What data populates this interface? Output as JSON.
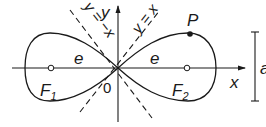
{
  "figure": {
    "labels": {
      "y_axis": "y",
      "x_axis": "x",
      "origin": "0",
      "focus_left": "F",
      "focus_left_sub": "1",
      "focus_right": "F",
      "focus_right_sub": "2",
      "point": "P",
      "e_left": "e",
      "e_right": "e",
      "asymptote_neg": "y = −x",
      "asymptote_pos": "y = x",
      "scale": "a"
    },
    "colors": {
      "stroke": "#1a1a1a",
      "background": "#ffffff"
    }
  }
}
